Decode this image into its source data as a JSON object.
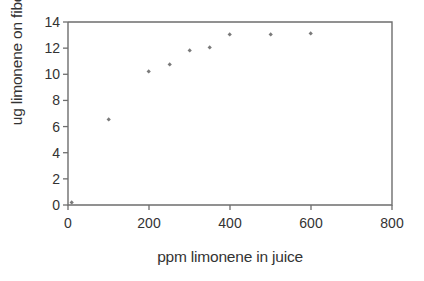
{
  "chart_data": {
    "type": "scatter",
    "title": "",
    "xlabel": "ppm limonene in juice",
    "ylabel": "ug limonene on fiber",
    "xlim": [
      0,
      800
    ],
    "ylim": [
      0,
      14
    ],
    "xticks": [
      0,
      200,
      400,
      600,
      800
    ],
    "yticks": [
      0,
      2,
      4,
      6,
      8,
      10,
      12,
      14
    ],
    "xtick_labels": [
      "0",
      "200",
      "400",
      "600",
      "800"
    ],
    "ytick_labels": [
      "0",
      "2",
      "4",
      "6",
      "8",
      "10",
      "12",
      "14"
    ],
    "grid": false,
    "legend": null,
    "marker": "diamond",
    "marker_color": "#7a7a7a",
    "frame_color": "#6e6e6e",
    "series": [
      {
        "name": "limonene uptake",
        "x": [
          10,
          100,
          200,
          250,
          300,
          350,
          400,
          500,
          600
        ],
        "y": [
          0.2,
          6.5,
          10.2,
          10.75,
          11.8,
          12.0,
          13.0,
          13.0,
          13.1
        ]
      }
    ]
  }
}
